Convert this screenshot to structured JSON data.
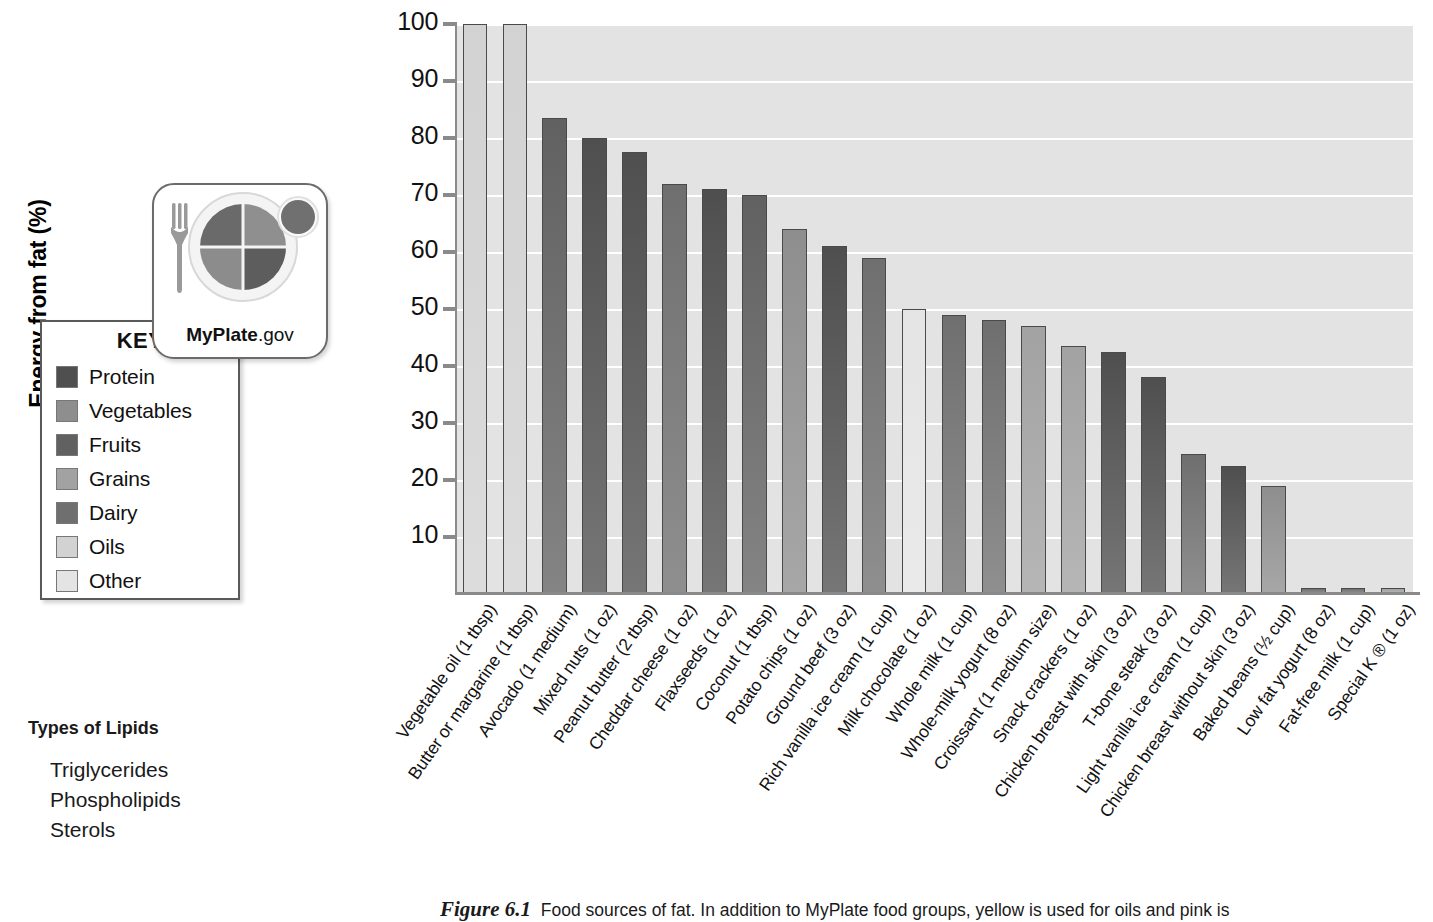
{
  "chart_data": {
    "type": "bar",
    "title": "",
    "xlabel": "",
    "ylabel": "Energy from fat (%)",
    "ylim": [
      0,
      100
    ],
    "yticks": [
      10,
      20,
      30,
      40,
      50,
      60,
      70,
      80,
      90,
      100
    ],
    "grid": true,
    "legend_position": "left-outside",
    "categories": [
      "Vegetable oil (1 tbsp)",
      "Butter or margarine (1 tbsp)",
      "Avocado (1 medium)",
      "Mixed nuts (1 oz)",
      "Peanut butter (2 tbsp)",
      "Cheddar cheese (1 oz)",
      "Flaxseeds (1 oz)",
      "Coconut (1 tbsp)",
      "Potato chips (1 oz)",
      "Ground beef (3 oz)",
      "Rich vanilla ice cream (1 cup)",
      "Milk chocolate (1 oz)",
      "Whole milk (1 cup)",
      "Whole-milk yogurt (8 oz)",
      "Croissant (1 medium size)",
      "Snack crackers (1 oz)",
      "Chicken breast with skin (3 oz)",
      "T-bone steak (3 oz)",
      "Light vanilla ice cream (1 cup)",
      "Chicken breast without skin (3 oz)",
      "Baked beans (½ cup)",
      "Low fat yogurt (8 oz)",
      "Fat-free milk (1 cup)",
      "Special K ® (1 oz)"
    ],
    "values": [
      100,
      100,
      83.5,
      80,
      77.5,
      72,
      71,
      70,
      64,
      61,
      59,
      50,
      49,
      48,
      47,
      43.5,
      42.5,
      38,
      24.5,
      22.5,
      19,
      1,
      1,
      1
    ],
    "bar_groups": [
      "Oils",
      "Oils",
      "Fruits",
      "Protein",
      "Protein",
      "Dairy",
      "Protein",
      "Fruits",
      "Vegetables",
      "Protein",
      "Dairy",
      "Other",
      "Dairy",
      "Dairy",
      "Grains",
      "Grains",
      "Protein",
      "Protein",
      "Dairy",
      "Protein",
      "Vegetables",
      "Dairy",
      "Dairy",
      "Grains"
    ]
  },
  "legend": {
    "title": "KEY",
    "items": [
      {
        "label": "Protein",
        "color": "#4f4f4f"
      },
      {
        "label": "Vegetables",
        "color": "#8e8e8e"
      },
      {
        "label": "Fruits",
        "color": "#616161"
      },
      {
        "label": "Grains",
        "color": "#a2a2a2"
      },
      {
        "label": "Dairy",
        "color": "#6f6f6f"
      },
      {
        "label": "Oils",
        "color": "#d2d2d2"
      },
      {
        "label": "Other",
        "color": "#e4e4e4"
      }
    ]
  },
  "myplate": {
    "brand": "MyPlate",
    "domain": ".gov",
    "segments": {
      "vegetables": "#6a6a6a",
      "fruits": "#8f8f8f",
      "grains": "#8c8c8c",
      "protein": "#5d5d5d",
      "dairy": "#707070"
    }
  },
  "lipids": {
    "title": "Types of Lipids",
    "items": [
      "Triglycerides",
      "Phospholipids",
      "Sterols"
    ]
  },
  "caption": {
    "figure_number": "Figure 6.1",
    "text": "Food sources of fat. In addition to MyPlate food groups, yellow is used for oils and pink is"
  },
  "colors": {
    "plot_background": "#e3e3e3",
    "gridline": "#ffffff",
    "axis": "#8a8a8a",
    "bar_outline": "#4a4a4a"
  }
}
